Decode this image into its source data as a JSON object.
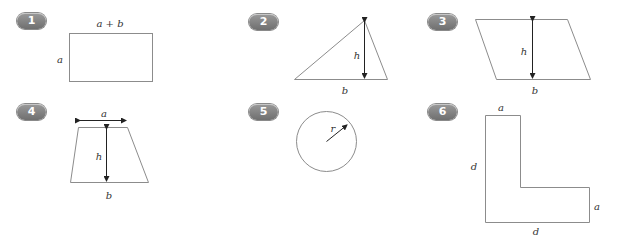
{
  "figures": [
    {
      "number": "1",
      "shape": "rectangle",
      "labels": {
        "top": "a + b",
        "left": "a"
      }
    },
    {
      "number": "2",
      "shape": "triangle",
      "labels": {
        "height": "h",
        "base": "b"
      }
    },
    {
      "number": "3",
      "shape": "parallelogram",
      "labels": {
        "height": "h",
        "base": "b"
      }
    },
    {
      "number": "4",
      "shape": "trapezoid",
      "labels": {
        "top": "a",
        "height": "h",
        "base": "b"
      }
    },
    {
      "number": "5",
      "shape": "circle",
      "labels": {
        "radius": "r"
      }
    },
    {
      "number": "6",
      "shape": "l-shape",
      "labels": {
        "top": "a",
        "left": "d",
        "right": "a",
        "bottom": "d"
      }
    }
  ],
  "colors": {
    "stroke": "#8c8c8c",
    "arrow": "#222222",
    "badge": "#7d7d7d",
    "text": "#333333"
  }
}
